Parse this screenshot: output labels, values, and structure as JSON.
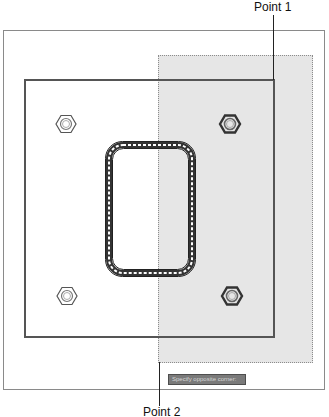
{
  "callouts": {
    "point1": {
      "label": "Point 1"
    },
    "point2": {
      "label": "Point 2"
    }
  },
  "cursor_tooltip": {
    "text": "Specify opposite corner:"
  },
  "drawing": {
    "objects": [
      {
        "type": "plate-rectangle",
        "selected": false
      },
      {
        "type": "rebar-rounded-rectangle",
        "selected": true
      },
      {
        "type": "hex-nut",
        "position": "top-left",
        "selected": false
      },
      {
        "type": "hex-nut",
        "position": "top-right",
        "selected": true
      },
      {
        "type": "hex-nut",
        "position": "bottom-left",
        "selected": false
      },
      {
        "type": "hex-nut",
        "position": "bottom-right",
        "selected": true
      }
    ],
    "selection_mode": "crossing-window"
  },
  "colors": {
    "selection_fill": "#e6e6e6",
    "selection_border": "#8c8c8c",
    "plate_border": "#555555",
    "tooltip_bg": "#7a7a7a"
  }
}
